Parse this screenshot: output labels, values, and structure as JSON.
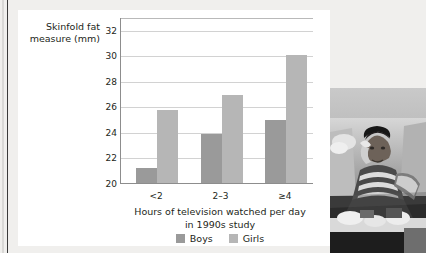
{
  "chart_data": {
    "type": "bar",
    "title": "",
    "categories": [
      "<2",
      "2–3",
      "≥4"
    ],
    "series": [
      {
        "name": "Boys",
        "values": [
          21.2,
          23.8,
          24.9
        ],
        "color": "#9a9a9a"
      },
      {
        "name": "Girls",
        "values": [
          25.7,
          26.9,
          30.0
        ],
        "color": "#b6b6b6"
      }
    ],
    "ylabel": "Skinfold fat\nmeasure (mm)",
    "xlabel": "Hours of television watched per day\nin 1990s study",
    "ylim": [
      20,
      33
    ],
    "yticks": [
      20,
      22,
      24,
      26,
      28,
      30,
      32
    ],
    "ytick_labels": [
      "20",
      "22",
      "24",
      "26",
      "28",
      "30",
      "32"
    ],
    "grid": true,
    "legend_position": "bottom"
  },
  "figure": {
    "axis_title_y": "Skinfold fat\nmeasure (mm)",
    "axis_title_x": "Hours of television watched per day\nin 1990s study",
    "legend": [
      {
        "label": "Boys"
      },
      {
        "label": "Girls"
      }
    ]
  },
  "photo": {
    "alt": "Black and white photograph of a seated youth eating snacks on a sofa surrounded by food wrappers"
  },
  "colors": {
    "boys": "#9a9a9a",
    "girls": "#b6b6b6",
    "grid": "#d2d2d2",
    "axis": "#8d8d8d",
    "text": "#231f20",
    "page_background": "#f0efed",
    "card_background": "#ffffff"
  }
}
